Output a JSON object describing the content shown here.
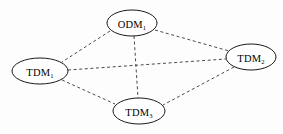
{
  "diagram": {
    "background_color": "#fdfdfd",
    "node_fill": "#ffffff",
    "node_stroke": "#1a1a1a",
    "edge_color": "#4a4a4a",
    "edge_style": "dashed",
    "nodes": [
      {
        "id": "odm1",
        "base": "ODM",
        "subscript": "1",
        "label": "ODM1",
        "cx": 132,
        "cy": 23,
        "rx": 25,
        "ry": 13
      },
      {
        "id": "tdm1",
        "base": "TDM",
        "subscript": "1",
        "label": "TDM1",
        "cx": 40,
        "cy": 71,
        "rx": 28,
        "ry": 13
      },
      {
        "id": "tdm2",
        "base": "TDM",
        "subscript": "2",
        "label": "TDM2",
        "cx": 251,
        "cy": 57,
        "rx": 25,
        "ry": 13
      },
      {
        "id": "tdm3",
        "base": "TDM",
        "subscript": "3",
        "label": "TDM3",
        "cx": 139,
        "cy": 111,
        "rx": 26,
        "ry": 13
      }
    ],
    "edges": [
      {
        "id": "odm1-tdm1",
        "from": "odm1",
        "to": "tdm1",
        "x1": 110,
        "y1": 31,
        "x2": 62,
        "y2": 62
      },
      {
        "id": "odm1-tdm2",
        "from": "odm1",
        "to": "tdm2",
        "x1": 155,
        "y1": 30,
        "x2": 229,
        "y2": 51
      },
      {
        "id": "odm1-tdm3",
        "from": "odm1",
        "to": "tdm3",
        "x1": 134,
        "y1": 36,
        "x2": 138,
        "y2": 98
      },
      {
        "id": "tdm1-tdm2",
        "from": "tdm1",
        "to": "tdm2",
        "x1": 68,
        "y1": 70,
        "x2": 226,
        "y2": 59
      },
      {
        "id": "tdm1-tdm3",
        "from": "tdm1",
        "to": "tdm3",
        "x1": 62,
        "y1": 80,
        "x2": 115,
        "y2": 104
      },
      {
        "id": "tdm2-tdm3",
        "from": "tdm2",
        "to": "tdm3",
        "x1": 234,
        "y1": 67,
        "x2": 163,
        "y2": 105
      }
    ]
  }
}
